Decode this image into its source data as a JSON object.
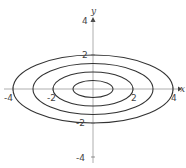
{
  "diagram": {
    "axes": {
      "x_label": "x",
      "y_label": "y",
      "x_ticks": [
        "-4",
        "-2",
        "2",
        "4"
      ],
      "y_ticks": [
        "4",
        "2",
        "-2",
        "-4"
      ]
    },
    "ellipses": [
      {
        "rx": 1,
        "ry": 0.5
      },
      {
        "rx": 2,
        "ry": 1
      },
      {
        "rx": 3,
        "ry": 1.5
      },
      {
        "rx": 4,
        "ry": 2
      }
    ],
    "colors": {
      "curve": "#333333",
      "axis": "#888888"
    }
  }
}
